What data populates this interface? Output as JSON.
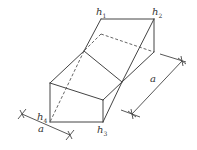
{
  "diagram": {
    "type": "geometric-solid",
    "colors": {
      "line": "#444444",
      "background": "#ffffff"
    },
    "vertices": {
      "h1": [
        101,
        19
      ],
      "h2": [
        154,
        19
      ],
      "h2_bottom": [
        154,
        52
      ],
      "back_dashed": [
        101,
        34
      ],
      "left_mid": [
        84,
        51
      ],
      "center": [
        122,
        82
      ],
      "left_box_top": [
        50,
        83
      ],
      "right_box_top": [
        103,
        100
      ],
      "h4": [
        50,
        122
      ],
      "h3": [
        103,
        122
      ]
    },
    "labels": {
      "h1": {
        "base": "h",
        "sub": "1"
      },
      "h2": {
        "base": "h",
        "sub": "2"
      },
      "h3": {
        "base": "h",
        "sub": "3"
      },
      "h4": {
        "base": "h",
        "sub": "4"
      },
      "dim_bottom": "a",
      "dim_right": "a"
    }
  }
}
